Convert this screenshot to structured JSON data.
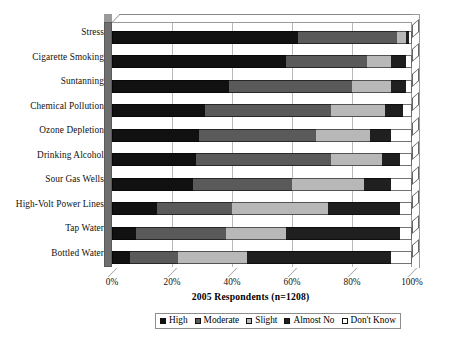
{
  "chart_data": {
    "type": "bar",
    "orientation": "horizontal",
    "stacked": true,
    "stacked_percent": true,
    "title": "",
    "xlabel": "2005 Respondents (n=1208)",
    "ylabel": "",
    "xlim": [
      0,
      100
    ],
    "xticks": [
      "0%",
      "20%",
      "40%",
      "60%",
      "80%",
      "100%"
    ],
    "xtick_values": [
      0,
      20,
      40,
      60,
      80,
      100
    ],
    "grid": true,
    "legend_position": "bottom",
    "categories": [
      "Stress",
      "Cigarette Smoking",
      "Suntanning",
      "Chemical Pollution",
      "Ozone Depletion",
      "Drinking Alcohol",
      "Sour Gas Wells",
      "High-Volt Power Lines",
      "Tap Water",
      "Bottled Water"
    ],
    "series": [
      {
        "name": "High",
        "color": "#111111",
        "values": [
          62,
          58,
          39,
          31,
          29,
          28,
          27,
          15,
          8,
          6
        ]
      },
      {
        "name": "Moderate",
        "color": "#5a5a5a",
        "values": [
          33,
          27,
          41,
          42,
          39,
          45,
          33,
          25,
          30,
          16
        ]
      },
      {
        "name": "Slight",
        "color": "#b8b8b8",
        "values": [
          3,
          8,
          13,
          18,
          18,
          17,
          24,
          32,
          20,
          23
        ]
      },
      {
        "name": "Almost No",
        "color": "#1f1f1f",
        "values": [
          1,
          5,
          5,
          6,
          7,
          6,
          9,
          24,
          38,
          48
        ]
      },
      {
        "name": "Don't Know",
        "color": "#ffffff",
        "values": [
          1,
          2,
          2,
          3,
          7,
          4,
          7,
          4,
          4,
          7
        ]
      }
    ]
  },
  "legend": {
    "items": [
      {
        "label": "High",
        "color": "#111111"
      },
      {
        "label": "Moderate",
        "color": "#5a5a5a"
      },
      {
        "label": "Slight",
        "color": "#b8b8b8"
      },
      {
        "label": "Almost No",
        "color": "#1f1f1f"
      },
      {
        "label": "Don't Know",
        "color": "#ffffff"
      }
    ]
  }
}
